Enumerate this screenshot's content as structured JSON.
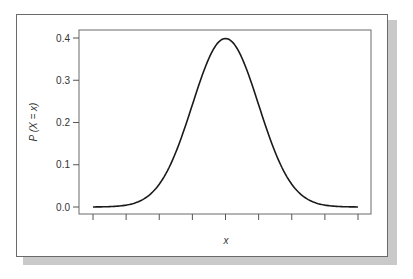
{
  "chart_data": {
    "type": "line",
    "title": "",
    "xlabel": "x",
    "ylabel": "P (X = x)",
    "ylim": [
      0.0,
      0.4
    ],
    "yticks": [
      "0.0",
      "0.1",
      "0.2",
      "0.3",
      "0.4"
    ],
    "xticks_count": 9,
    "xtick_labels": [],
    "grid": false,
    "legend": null,
    "series": [
      {
        "name": "normal density",
        "description": "Standard normal probability density curve, peak 0.4 at center",
        "x": [
          -4,
          -3.5,
          -3,
          -2.5,
          -2,
          -1.5,
          -1,
          -0.5,
          0,
          0.5,
          1,
          1.5,
          2,
          2.5,
          3,
          3.5,
          4
        ],
        "values": [
          0.0001,
          0.0009,
          0.0044,
          0.0175,
          0.054,
          0.1295,
          0.242,
          0.3521,
          0.3989,
          0.3521,
          0.242,
          0.1295,
          0.054,
          0.0175,
          0.0044,
          0.0009,
          0.0001
        ]
      }
    ],
    "colors": {
      "line": "#1a1a1a",
      "frame": "#6a6a6a",
      "shadow": "#c9c9c9"
    }
  }
}
